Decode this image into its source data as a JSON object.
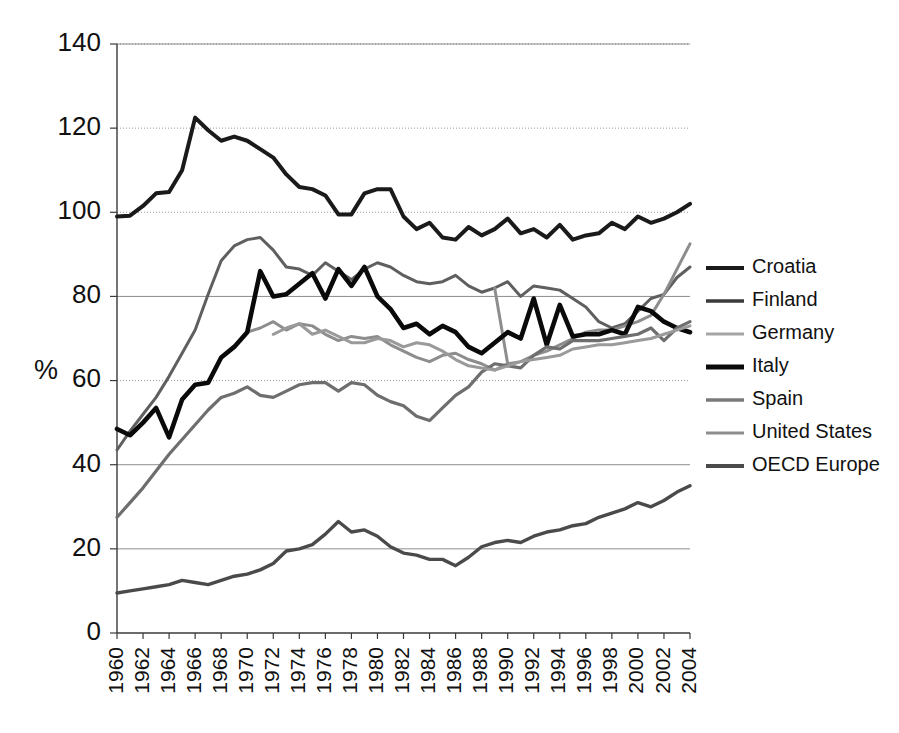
{
  "chart_data": {
    "type": "line",
    "title": "",
    "xlabel": "",
    "ylabel": "%",
    "xlim": [
      1960,
      2004
    ],
    "ylim": [
      0,
      140
    ],
    "yticks": [
      0,
      20,
      40,
      60,
      80,
      100,
      120,
      140
    ],
    "grid": true,
    "legend_position": "right",
    "x": [
      1960,
      1961,
      1962,
      1963,
      1964,
      1965,
      1966,
      1967,
      1968,
      1969,
      1970,
      1971,
      1972,
      1973,
      1974,
      1975,
      1976,
      1977,
      1978,
      1979,
      1980,
      1981,
      1982,
      1983,
      1984,
      1985,
      1986,
      1987,
      1988,
      1989,
      1990,
      1991,
      1992,
      1993,
      1994,
      1995,
      1996,
      1997,
      1998,
      1999,
      2000,
      2001,
      2002,
      2003,
      2004
    ],
    "xtick_labels": [
      "1960",
      "1962",
      "1964",
      "1966",
      "1968",
      "1970",
      "1972",
      "1974",
      "1976",
      "1978",
      "1980",
      "1982",
      "1984",
      "1986",
      "1988",
      "1990",
      "1992",
      "1994",
      "1996",
      "1998",
      "2000",
      "2002",
      "2004"
    ],
    "series": [
      {
        "name": "Croatia",
        "color": "#1a1a1a",
        "width": 4.0,
        "values": [
          99.0,
          99.2,
          101.5,
          104.5,
          104.8,
          110.0,
          122.5,
          119.5,
          117.0,
          118.0,
          117.0,
          115.0,
          113.0,
          109.0,
          106.0,
          105.5,
          104.0,
          99.5,
          99.5,
          104.5,
          105.5,
          105.5,
          99.0,
          96.0,
          97.5,
          94.0,
          93.5,
          96.5,
          94.5,
          96.0,
          98.5,
          95.0,
          96.0,
          94.0,
          97.0,
          93.5,
          94.5,
          95.0,
          97.5,
          96.0,
          99.0,
          97.5,
          98.5,
          100.0,
          102.0
        ]
      },
      {
        "name": "Finland",
        "color": "#5f5f5f",
        "width": 3.0,
        "values": [
          43.5,
          48.0,
          52.0,
          56.0,
          61.0,
          66.5,
          72.0,
          80.5,
          88.5,
          92.0,
          93.5,
          94.0,
          91.0,
          87.0,
          86.5,
          85.0,
          88.0,
          86.0,
          84.0,
          86.5,
          88.0,
          87.0,
          85.0,
          83.5,
          83.0,
          83.5,
          85.0,
          82.5,
          81.0,
          82.0,
          83.5,
          80.0,
          82.5,
          82.0,
          81.5,
          79.5,
          77.5,
          74.0,
          72.5,
          73.5,
          76.5,
          79.5,
          80.5,
          84.5,
          87.0
        ]
      },
      {
        "name": "Germany",
        "color": "#8d8d8d",
        "width": 3.0,
        "values": [
          null,
          null,
          null,
          null,
          null,
          null,
          null,
          null,
          null,
          null,
          71.5,
          72.5,
          74.0,
          72.0,
          73.5,
          73.0,
          71.0,
          69.5,
          70.5,
          70.0,
          70.5,
          68.5,
          67.0,
          65.5,
          64.5,
          66.0,
          66.5,
          65.0,
          64.0,
          62.5,
          64.0,
          64.5,
          66.0,
          67.0,
          68.5,
          70.0,
          71.5,
          72.0,
          72.0,
          73.0,
          74.0,
          75.5,
          80.5,
          86.5,
          92.5
        ]
      },
      {
        "name": "Germany break",
        "color": "#8d8d8d",
        "width": 3.0,
        "values": [
          null,
          null,
          null,
          null,
          null,
          null,
          null,
          null,
          null,
          null,
          null,
          null,
          null,
          null,
          null,
          null,
          null,
          null,
          null,
          null,
          null,
          null,
          null,
          null,
          null,
          null,
          null,
          null,
          null,
          82.0,
          64.0,
          null,
          null,
          null,
          null,
          null,
          null,
          null,
          null,
          null,
          null,
          null,
          null,
          null,
          null
        ]
      },
      {
        "name": "Italy",
        "color": "#0a0a0a",
        "width": 4.6,
        "values": [
          48.5,
          47.0,
          50.0,
          53.5,
          46.5,
          55.5,
          59.0,
          59.5,
          65.5,
          68.0,
          71.5,
          86.0,
          80.0,
          80.5,
          83.0,
          85.5,
          79.5,
          86.5,
          82.5,
          87.0,
          80.0,
          77.0,
          72.5,
          73.5,
          71.0,
          73.0,
          71.5,
          68.0,
          66.5,
          69.0,
          71.5,
          70.0,
          79.5,
          68.5,
          78.0,
          70.5,
          71.0,
          71.0,
          72.0,
          71.0,
          77.5,
          76.5,
          74.0,
          72.5,
          71.5
        ]
      },
      {
        "name": "Spain",
        "color": "#6e6e6e",
        "width": 3.2,
        "values": [
          27.5,
          31.0,
          34.5,
          38.5,
          42.5,
          46.0,
          49.5,
          53.0,
          56.0,
          57.0,
          58.5,
          56.5,
          56.0,
          57.5,
          59.0,
          59.5,
          59.5,
          57.5,
          59.5,
          59.0,
          56.5,
          55.0,
          54.0,
          51.5,
          50.5,
          53.5,
          56.5,
          58.5,
          62.0,
          64.0,
          63.5,
          63.0,
          66.0,
          68.0,
          67.5,
          69.5,
          69.5,
          69.5,
          70.0,
          70.5,
          71.0,
          72.5,
          69.5,
          72.5,
          74.0
        ]
      },
      {
        "name": "United States",
        "color": "#9a9a9a",
        "width": 3.0,
        "values": [
          null,
          null,
          null,
          null,
          null,
          null,
          null,
          null,
          null,
          null,
          null,
          null,
          71.0,
          72.5,
          73.5,
          71.0,
          72.0,
          70.5,
          69.0,
          69.0,
          70.0,
          69.5,
          68.0,
          69.0,
          68.5,
          67.0,
          65.0,
          63.5,
          63.0,
          62.5,
          63.5,
          64.5,
          65.0,
          65.5,
          66.0,
          67.5,
          68.0,
          68.5,
          68.5,
          69.0,
          69.5,
          70.0,
          71.0,
          72.0,
          73.0
        ]
      },
      {
        "name": "OECD Europe",
        "color": "#4a4a4a",
        "width": 3.4,
        "values": [
          9.5,
          10.0,
          10.5,
          11.0,
          11.5,
          12.5,
          12.0,
          11.5,
          12.5,
          13.5,
          14.0,
          15.0,
          16.5,
          19.5,
          20.0,
          21.0,
          23.5,
          26.5,
          24.0,
          24.5,
          23.0,
          20.5,
          19.0,
          18.5,
          17.5,
          17.5,
          16.0,
          18.0,
          20.5,
          21.5,
          22.0,
          21.5,
          23.0,
          24.0,
          24.5,
          25.5,
          26.0,
          27.5,
          28.5,
          29.5,
          31.0,
          30.0,
          31.5,
          33.5,
          35.0
        ]
      }
    ]
  },
  "legend": {
    "items": [
      {
        "label": "Croatia",
        "color": "#1a1a1a",
        "width": 4.0
      },
      {
        "label": "Finland",
        "color": "#3a3a3a",
        "width": 3.4
      },
      {
        "label": "Germany",
        "color": "#a5a5a5",
        "width": 3.0
      },
      {
        "label": "Italy",
        "color": "#0a0a0a",
        "width": 5.0
      },
      {
        "label": "Spain",
        "color": "#7a7a7a",
        "width": 3.4
      },
      {
        "label": "United States",
        "color": "#8d8d8d",
        "width": 3.0
      },
      {
        "label": "OECD Europe",
        "color": "#4a4a4a",
        "width": 4.0
      }
    ]
  },
  "axes": {
    "y_title": "%",
    "y_labels": [
      "140",
      "120",
      "100",
      "80",
      "60",
      "40",
      "20",
      "0"
    ]
  }
}
